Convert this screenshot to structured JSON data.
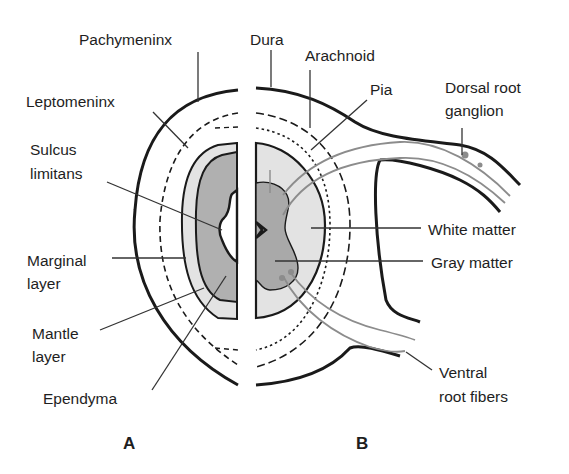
{
  "figure": {
    "panels": [
      {
        "id": "A",
        "label": "A"
      },
      {
        "id": "B",
        "label": "B"
      }
    ],
    "labels_a": {
      "pachymeninx": "Pachymeninx",
      "leptomeninx": "Leptomeninx",
      "sulcus_1": "Sulcus",
      "sulcus_2": "limitans",
      "marginal_1": "Marginal",
      "marginal_2": "layer",
      "mantle_1": "Mantle",
      "mantle_2": "layer",
      "ependyma": "Ependyma"
    },
    "labels_b": {
      "dura": "Dura",
      "arachnoid": "Arachnoid",
      "pia": "Pia",
      "drg_1": "Dorsal root",
      "drg_2": "ganglion",
      "white_matter": "White matter",
      "gray_matter": "Gray matter",
      "ventral_1": "Ventral",
      "ventral_2": "root fibers"
    },
    "colors": {
      "outline": "#1a1a1a",
      "light_fill": "#e3e3e3",
      "dark_fill": "#a9a9a9",
      "nerve": "#8c8c8c"
    }
  }
}
